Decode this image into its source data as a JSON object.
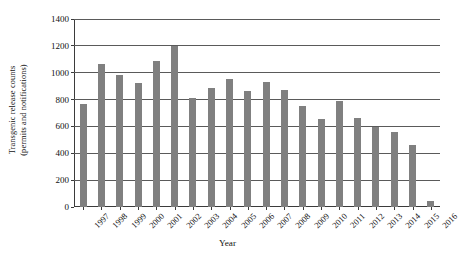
{
  "chart_data": {
    "type": "bar",
    "title": "",
    "xlabel": "Year",
    "ylabel": "Transgenic release counts (permits and notifications)",
    "ylabel_line1": "Transgenic release counts",
    "ylabel_line2": "(permits and notifications)",
    "categories": [
      "1997",
      "1998",
      "1999",
      "2000",
      "2001",
      "2002",
      "2003",
      "2004",
      "2005",
      "2006",
      "2007",
      "2008",
      "2009",
      "2010",
      "2011",
      "2012",
      "2013",
      "2014",
      "2015",
      "2016"
    ],
    "values": [
      765,
      1065,
      980,
      920,
      1085,
      1200,
      810,
      890,
      955,
      865,
      930,
      870,
      750,
      655,
      790,
      660,
      595,
      555,
      465,
      45
    ],
    "ylim": [
      0,
      1400
    ],
    "yticks": [
      0,
      200,
      400,
      600,
      800,
      1000,
      1200,
      1400
    ],
    "ytick_labels": [
      "0",
      "200",
      "400",
      "600",
      "800",
      "1000",
      "1200",
      "1400"
    ],
    "grid": "horizontal",
    "legend": "none",
    "bar_color": "#808080",
    "axis_color": "#3b3b3b",
    "grid_color": "#5a5a5a",
    "background_color": "#ffffff",
    "series": [
      {
        "name": "Transgenic release counts",
        "values": [
          765,
          1065,
          980,
          920,
          1085,
          1200,
          810,
          890,
          955,
          865,
          930,
          870,
          750,
          655,
          790,
          660,
          595,
          555,
          465,
          45
        ]
      }
    ]
  }
}
